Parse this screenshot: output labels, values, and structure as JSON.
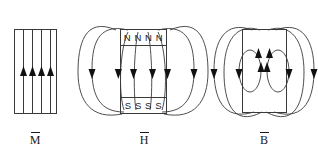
{
  "figure": {
    "type": "physics-diagram",
    "background_color": "#ffffff",
    "line_color": "#3a3a3a",
    "text_color": "#1a1a1a"
  },
  "panels": [
    {
      "id": "panel-m",
      "label": "M",
      "overbar": true,
      "quantity": "magnetization",
      "rectangle": {
        "x": 14,
        "y": 29,
        "width": 42,
        "height": 84
      },
      "field_line_count": 4,
      "field_direction": "up",
      "has_outer_loops": false,
      "pole_labels": []
    },
    {
      "id": "panel-h",
      "label": "H",
      "overbar": true,
      "quantity": "magnetic-field-strength",
      "rectangle": {
        "x": 120,
        "y": 29,
        "width": 46,
        "height": 84
      },
      "field_direction": "down-inside",
      "has_outer_loops": true,
      "outer_loop_count": 2,
      "inner_line_count": 4,
      "pole_labels": [
        {
          "text": "N N N N",
          "position": "top"
        },
        {
          "text": "S S S S",
          "position": "bottom"
        }
      ]
    },
    {
      "id": "panel-b",
      "label": "B",
      "overbar": true,
      "quantity": "magnetic-flux-density",
      "rectangle": {
        "x": 242,
        "y": 29,
        "width": 44,
        "height": 83
      },
      "field_direction": "up-inside-continuous-loops",
      "has_outer_loops": true,
      "outer_loop_count": 2,
      "inner_loop_count": 2,
      "pole_labels": []
    }
  ]
}
